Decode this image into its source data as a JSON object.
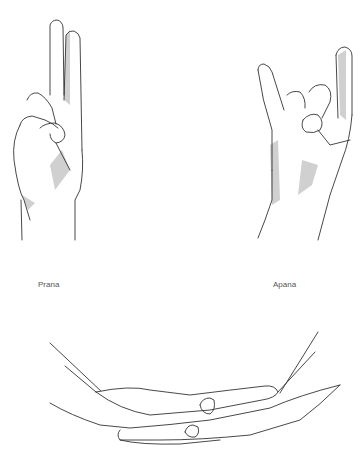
{
  "figures": [
    {
      "id": "prana",
      "label": "Prana",
      "description": "Hand with index and middle fingers extended, ring and little fingers touching thumb"
    },
    {
      "id": "apana",
      "label": "Apana",
      "description": "Hand with index and little fingers extended, middle and ring fingers touching thumb"
    },
    {
      "id": "dhyana",
      "label": "",
      "description": "Two hands resting palm-up, one on top of the other"
    }
  ],
  "colors": {
    "background": "#ffffff",
    "line": "#333333",
    "shade": "#d0d0d0",
    "label": "#555555"
  }
}
